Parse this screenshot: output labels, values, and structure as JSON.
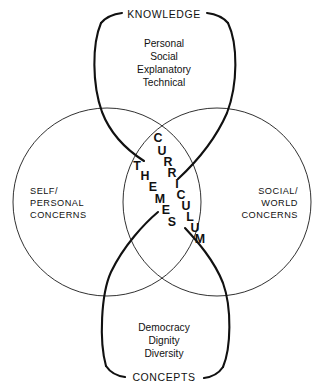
{
  "diagram": {
    "colors": {
      "line": "#1a1a1a",
      "loop_line": "#111111",
      "text": "#111111",
      "background": "#ffffff"
    },
    "top_loop": {
      "name": "knowledge-loop",
      "label": "KNOWLEDGE",
      "items": [
        "Personal",
        "Social",
        "Explanatory",
        "Technical"
      ]
    },
    "bottom_loop": {
      "name": "concepts-loop",
      "label": "CONCEPTS",
      "items": [
        "Democracy",
        "Dignity",
        "Diversity"
      ]
    },
    "left_circle": {
      "name": "self-personal-concerns-circle",
      "lines": [
        "SELF/",
        "PERSONAL",
        "CONCERNS"
      ]
    },
    "right_circle": {
      "name": "social-world-concerns-circle",
      "lines": [
        "SOCIAL/",
        "WORLD",
        "CONCERNS"
      ]
    },
    "center": {
      "word_themes": "THEMES",
      "word_curriculum": "CURRICULUM",
      "themes_letters": [
        {
          "ch": "T",
          "x": 137,
          "y": 170
        },
        {
          "ch": "H",
          "x": 145,
          "y": 180
        },
        {
          "ch": "E",
          "x": 153,
          "y": 191
        },
        {
          "ch": "M",
          "x": 160,
          "y": 203
        },
        {
          "ch": "E",
          "x": 166,
          "y": 214
        },
        {
          "ch": "S",
          "x": 172,
          "y": 226
        }
      ],
      "curriculum_letters": [
        {
          "ch": "C",
          "x": 158,
          "y": 142
        },
        {
          "ch": "U",
          "x": 162,
          "y": 155
        },
        {
          "ch": "R",
          "x": 168,
          "y": 166
        },
        {
          "ch": "R",
          "x": 172,
          "y": 177
        },
        {
          "ch": "I",
          "x": 177,
          "y": 188
        },
        {
          "ch": "C",
          "x": 181,
          "y": 199
        },
        {
          "ch": "U",
          "x": 186,
          "y": 210
        },
        {
          "ch": "L",
          "x": 190,
          "y": 221
        },
        {
          "ch": "U",
          "x": 195,
          "y": 232
        },
        {
          "ch": "M",
          "x": 200,
          "y": 243
        }
      ]
    }
  }
}
